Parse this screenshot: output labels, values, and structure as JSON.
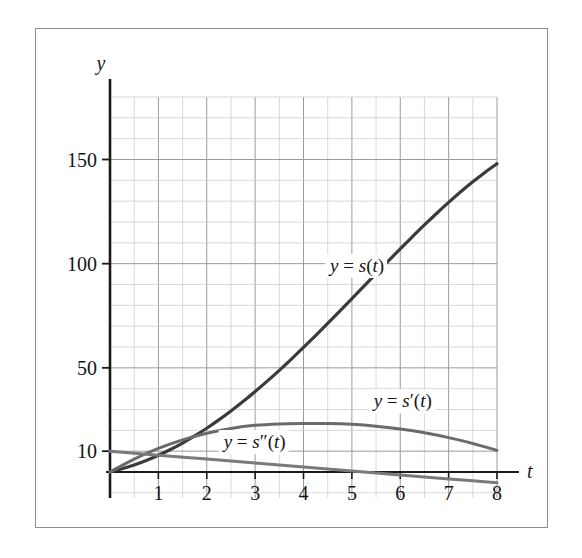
{
  "chart_data": {
    "type": "line",
    "title": "",
    "xlabel": "t",
    "ylabel": "y",
    "xlim": [
      0,
      8.35
    ],
    "ylim": [
      -12,
      180
    ],
    "grid": true,
    "grid_step_x": 0.5,
    "grid_step_y": 10,
    "legend": "inline-labels",
    "x_ticks": [
      1,
      2,
      3,
      4,
      5,
      6,
      7,
      8
    ],
    "x_tick_labels": [
      "1",
      "2",
      "3",
      "4",
      "5",
      "6",
      "7",
      "8"
    ],
    "y_ticks": [
      10,
      50,
      100,
      150
    ],
    "y_tick_labels": [
      "10",
      "50",
      "100",
      "150"
    ],
    "series": [
      {
        "name": "y = s(t)",
        "label_parts": {
          "y": "y",
          "eq": "=",
          "s": "s",
          "prime": "",
          "arg": "(t)"
        },
        "color": "#3b3b3b",
        "width": 3.2,
        "label_x": 4.55,
        "label_y": 96,
        "x": [
          0,
          0.25,
          0.5,
          0.75,
          1,
          1.25,
          1.5,
          1.75,
          2,
          2.25,
          2.5,
          2.75,
          3,
          3.25,
          3.5,
          3.75,
          4,
          4.25,
          4.5,
          4.75,
          5,
          5.25,
          5.5,
          5.75,
          6,
          6.25,
          6.5,
          6.75,
          7,
          7.25,
          7.5,
          7.75,
          8
        ],
        "y": [
          0,
          1.6,
          3.4,
          5.5,
          8.0,
          10.8,
          13.9,
          17.3,
          21.0,
          25.0,
          29.3,
          33.8,
          38.6,
          43.6,
          48.8,
          54.2,
          59.8,
          65.5,
          71.3,
          77.2,
          83.2,
          89.2,
          95.2,
          101.2,
          107.1,
          112.9,
          118.6,
          124.1,
          129.4,
          134.5,
          139.3,
          143.8,
          148.0
        ]
      },
      {
        "name": "y = s'(t)",
        "label_parts": {
          "y": "y",
          "eq": "=",
          "s": "s",
          "prime": "′",
          "arg": "(t)"
        },
        "color": "#6b6b6b",
        "width": 3.0,
        "label_x": 5.45,
        "label_y": 31,
        "x": [
          0,
          0.5,
          1,
          1.5,
          2,
          2.5,
          3,
          3.5,
          4,
          4.5,
          5,
          5.5,
          6,
          6.5,
          7,
          7.5,
          8
        ],
        "y": [
          0,
          6.2,
          11.3,
          15.4,
          18.6,
          20.9,
          22.4,
          23.1,
          23.3,
          23.3,
          22.9,
          22.0,
          20.6,
          18.8,
          16.5,
          13.7,
          10.4
        ]
      },
      {
        "name": "y = s''(t)",
        "label_parts": {
          "y": "y",
          "eq": "=",
          "s": "s",
          "prime": "″",
          "arg": "(t)"
        },
        "color": "#7a7a7a",
        "width": 3.0,
        "label_x": 2.35,
        "label_y": 11.5,
        "x": [
          0,
          1,
          2,
          3,
          4,
          5,
          6,
          7,
          8
        ],
        "y": [
          10.0,
          8.1,
          6.2,
          4.3,
          2.4,
          0.5,
          -1.4,
          -3.3,
          -5.2
        ]
      }
    ],
    "annotations": [
      {
        "name": "y-axis-letter",
        "text": "y"
      },
      {
        "name": "x-axis-letter",
        "text": "t"
      }
    ]
  },
  "colors": {
    "frame": "#8d8d8d",
    "axis": "#1a1a1a",
    "grid_major": "#9a9aa2",
    "grid_minor": "#c9c9cf",
    "background": "#ffffff"
  }
}
